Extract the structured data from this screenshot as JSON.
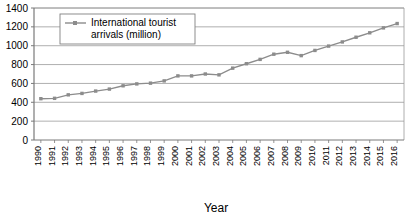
{
  "chart_data": {
    "type": "line",
    "title": "",
    "xlabel": "Year",
    "ylabel": "",
    "ylim": [
      0,
      1400
    ],
    "ytick_step": 200,
    "yticks": [
      "0",
      "200",
      "400",
      "600",
      "800",
      "1000",
      "1200",
      "1400"
    ],
    "grid": true,
    "legend_position": "top-left-inside",
    "legend": [
      "International tourist arrivals (million)"
    ],
    "series_color": "#8c8c8c",
    "categories": [
      "1990",
      "1991",
      "1992",
      "1993",
      "1994",
      "1995",
      "1996",
      "1997",
      "1998",
      "1999",
      "2000",
      "2001",
      "2002",
      "2003",
      "2004",
      "2005",
      "2006",
      "2007",
      "2008",
      "2009",
      "2010",
      "2011",
      "2012",
      "2013",
      "2014",
      "2015",
      "2016"
    ],
    "series": [
      {
        "name": "International tourist arrivals (million)",
        "values": [
          438,
          442,
          479,
          494,
          519,
          540,
          575,
          595,
          603,
          627,
          680,
          680,
          700,
          691,
          762,
          809,
          855,
          910,
          930,
          895,
          950,
          996,
          1040,
          1090,
          1137,
          1189,
          1235
        ]
      }
    ]
  },
  "legend": {
    "line1": "International tourist",
    "line2": "arrivals (million)"
  },
  "axis": {
    "x_title": "Year"
  }
}
